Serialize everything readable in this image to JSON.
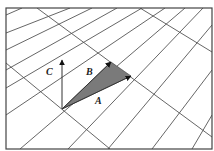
{
  "diagram": {
    "title": "",
    "frame": {
      "x": 6,
      "y": 8,
      "width": 206,
      "height": 141
    },
    "colors": {
      "grid": "#555555",
      "triangle_fill": "#7a7a7a",
      "vector": "#333333",
      "label": "#222222",
      "background": "#ffffff"
    },
    "grid_lines": {
      "rising": [
        [
          6,
          15,
          22,
          8
        ],
        [
          6,
          33,
          70,
          8
        ],
        [
          6,
          50,
          92,
          8
        ],
        [
          6,
          70,
          117,
          8
        ],
        [
          6,
          88,
          142,
          8
        ],
        [
          6,
          115,
          165,
          8
        ],
        [
          20,
          149,
          185,
          8
        ],
        [
          68,
          149,
          203,
          8
        ],
        [
          108,
          149,
          212,
          25
        ],
        [
          152,
          149,
          212,
          70
        ],
        [
          192,
          149,
          212,
          115
        ]
      ],
      "falling": [
        [
          37,
          8,
          212,
          137
        ],
        [
          140,
          8,
          212,
          52
        ],
        [
          6,
          63,
          110,
          149
        ]
      ]
    },
    "origin": {
      "x": 62,
      "y": 109
    },
    "vectors": [
      {
        "name": "A",
        "label": "A",
        "tip": {
          "x": 131,
          "y": 76
        },
        "label_pos": {
          "x": 95,
          "y": 104
        }
      },
      {
        "name": "B",
        "label": "B",
        "tip": {
          "x": 111,
          "y": 62
        },
        "label_pos": {
          "x": 86,
          "y": 75
        }
      },
      {
        "name": "C",
        "label": "C",
        "tip": {
          "x": 62,
          "y": 60
        },
        "label_pos": {
          "x": 46,
          "y": 75
        }
      }
    ],
    "shaded_triangle": "origin, B tip, A tip"
  }
}
